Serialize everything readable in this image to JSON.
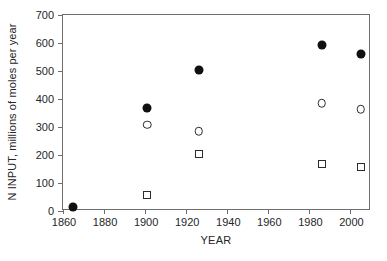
{
  "chart_data": {
    "type": "scatter",
    "title": "",
    "xlabel": "YEAR",
    "ylabel": "N INPUT, millions of moles per year",
    "xlim": [
      1860,
      2010
    ],
    "ylim": [
      0,
      700
    ],
    "xticks": [
      1860,
      1880,
      1900,
      1920,
      1940,
      1960,
      1980,
      2000
    ],
    "yticks": [
      0,
      100,
      200,
      300,
      400,
      500,
      600,
      700
    ],
    "grid": false,
    "legend": "none",
    "series": [
      {
        "name": "filled-circle",
        "marker": "filled circle",
        "points": [
          {
            "x": 1865,
            "y": 13
          },
          {
            "x": 1901,
            "y": 368
          },
          {
            "x": 1926,
            "y": 502
          },
          {
            "x": 1986,
            "y": 594
          },
          {
            "x": 2005,
            "y": 562
          }
        ]
      },
      {
        "name": "open-circle",
        "marker": "open circle",
        "points": [
          {
            "x": 1901,
            "y": 308
          },
          {
            "x": 1926,
            "y": 285
          },
          {
            "x": 1986,
            "y": 384
          },
          {
            "x": 2005,
            "y": 363
          }
        ]
      },
      {
        "name": "open-square",
        "marker": "open square",
        "points": [
          {
            "x": 1901,
            "y": 57
          },
          {
            "x": 1926,
            "y": 205
          },
          {
            "x": 1986,
            "y": 169
          },
          {
            "x": 2005,
            "y": 158
          }
        ]
      }
    ]
  },
  "colors": {
    "axis": "#6d6d6d",
    "text": "#262626",
    "filled_marker": "#101010",
    "open_marker": "#2b2b2b",
    "background": "#ffffff"
  }
}
